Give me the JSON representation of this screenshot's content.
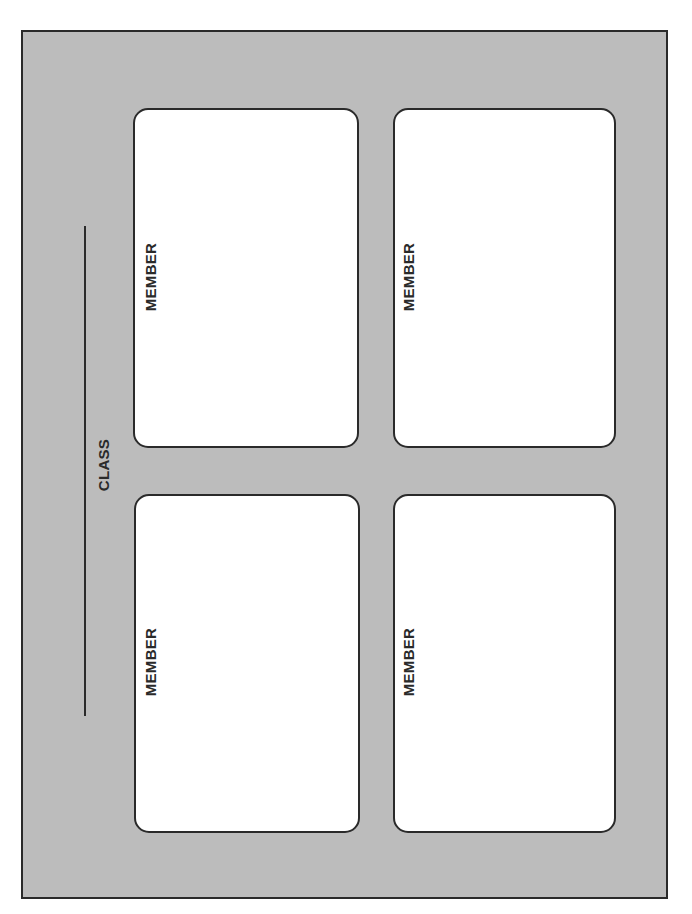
{
  "diagram": {
    "class_label": "CLASS",
    "members": [
      {
        "label": "MEMBER"
      },
      {
        "label": "MEMBER"
      },
      {
        "label": "MEMBER"
      },
      {
        "label": "MEMBER"
      }
    ]
  },
  "colors": {
    "background": "#bcbcbc",
    "card": "#ffffff",
    "stroke": "#2a2a2a"
  }
}
